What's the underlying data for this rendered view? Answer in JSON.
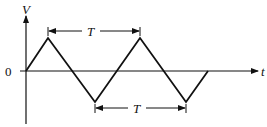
{
  "diagram": {
    "type": "triangle-wave",
    "axis_labels": {
      "vertical": "V",
      "horizontal": "t",
      "origin": "0"
    },
    "period_label_top": "T",
    "period_label_bottom": "T",
    "colors": {
      "line": "#111111",
      "background": "#ffffff"
    }
  }
}
